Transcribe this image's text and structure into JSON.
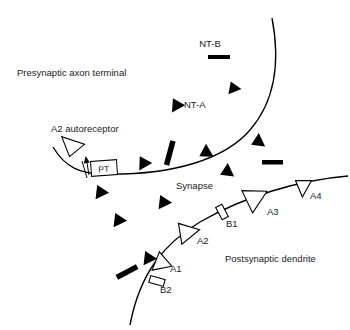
{
  "figure": {
    "background_color": "#ffffff",
    "ink_color": "#000000"
  },
  "labels": {
    "presynaptic": "Presynaptic axon terminal",
    "postsynaptic": "Postsynaptic dendrite",
    "synapse": "Synapse",
    "autoreceptor": "A2 autoreceptor",
    "nt_a": "NT-A",
    "nt_b": "NT-B",
    "pt": "PT",
    "a1": "A1",
    "a2": "A2",
    "a3": "A3",
    "a4": "A4",
    "b1": "B1",
    "b2": "B2"
  },
  "legend_items": [
    {
      "key": "nt_a",
      "label": "NT-A",
      "glyph": "filled-triangle"
    },
    {
      "key": "nt_b",
      "label": "NT-B",
      "glyph": "filled-bar"
    },
    {
      "key": "pt",
      "label": "PT",
      "glyph": "transporter-box-with-arrow"
    }
  ],
  "receptors": [
    {
      "id": "a2_auto",
      "label": "A2 autoreceptor",
      "glyph": "open-triangle",
      "membrane": "presynaptic"
    },
    {
      "id": "a1",
      "label": "A1",
      "glyph": "open-triangle",
      "membrane": "postsynaptic"
    },
    {
      "id": "a2",
      "label": "A2",
      "glyph": "open-triangle",
      "membrane": "postsynaptic"
    },
    {
      "id": "a3",
      "label": "A3",
      "glyph": "open-triangle",
      "membrane": "postsynaptic"
    },
    {
      "id": "a4",
      "label": "A4",
      "glyph": "open-triangle",
      "membrane": "postsynaptic"
    },
    {
      "id": "b1",
      "label": "B1",
      "glyph": "open-rectangle",
      "membrane": "postsynaptic"
    },
    {
      "id": "b2",
      "label": "B2",
      "glyph": "open-rectangle",
      "membrane": "postsynaptic"
    }
  ]
}
